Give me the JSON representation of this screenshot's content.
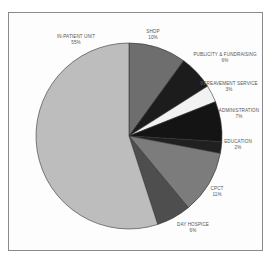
{
  "chart_data": {
    "type": "pie",
    "title": "",
    "start_angle_deg": 0,
    "direction": "clockwise",
    "center": [
      129,
      136
    ],
    "radius": 93,
    "slices": [
      {
        "label": "SHOP",
        "value": 10,
        "pct_label": "10%",
        "color": "#6e6e6e",
        "label_pos": [
          153,
          29
        ]
      },
      {
        "label": "PUBLICITY & FUNDRAISING",
        "value": 6,
        "pct_label": "6%",
        "color": "#1c1c1c",
        "label_pos": [
          225,
          52
        ]
      },
      {
        "label": "BEREAVEMENT SERVICE",
        "value": 3,
        "pct_label": "3%",
        "color": "#f2f2f2",
        "label_pos": [
          229,
          81
        ]
      },
      {
        "label": "ADMINISTRATION",
        "value": 7,
        "pct_label": "7%",
        "color": "#141414",
        "label_pos": [
          239,
          108
        ]
      },
      {
        "label": "EDUCATION",
        "value": 2,
        "pct_label": "2%",
        "color": "#202020",
        "label_pos": [
          238,
          139
        ]
      },
      {
        "label": "CPCT",
        "value": 11,
        "pct_label": "11%",
        "color": "#7c7c7c",
        "label_pos": [
          217,
          186
        ]
      },
      {
        "label": "DAY HOSPICE",
        "value": 6,
        "pct_label": "6%",
        "color": "#4e4e4e",
        "label_pos": [
          193,
          222
        ]
      },
      {
        "label": "IN-PATIENT UNIT",
        "value": 55,
        "pct_label": "55%",
        "color": "#bdbdbd",
        "label_pos": [
          76,
          34
        ]
      }
    ]
  }
}
